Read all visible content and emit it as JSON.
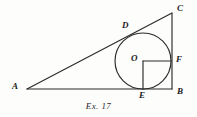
{
  "figure": {
    "caption": "Ex. 17",
    "background_color": "#fdfdfc",
    "stroke_color": "#2b2b2b",
    "labels": {
      "A": "A",
      "B": "B",
      "C": "C",
      "D": "D",
      "E": "E",
      "F": "F",
      "O": "O"
    },
    "label_positions": {
      "A": {
        "x": 12,
        "y": 82
      },
      "B": {
        "x": 177,
        "y": 87
      },
      "C": {
        "x": 177,
        "y": 4
      },
      "D": {
        "x": 122,
        "y": 21
      },
      "E": {
        "x": 139,
        "y": 91
      },
      "F": {
        "x": 176,
        "y": 55
      },
      "O": {
        "x": 131,
        "y": 54
      }
    },
    "geometry": {
      "type": "right-triangle-with-inscribed-circle",
      "triangle": {
        "vertices": {
          "A": {
            "x": 27,
            "y": 89
          },
          "B": {
            "x": 172,
            "y": 89
          },
          "C": {
            "x": 172,
            "y": 13
          }
        },
        "sides": [
          "AB",
          "BC",
          "CA"
        ],
        "right_angle_at": "B"
      },
      "incircle": {
        "center": {
          "x": 143,
          "y": 61
        },
        "radius": 28
      },
      "tangent_points": {
        "D": {
          "x": 130,
          "y": 34
        },
        "E": {
          "x": 143,
          "y": 89
        },
        "F": {
          "x": 171,
          "y": 61
        }
      },
      "radii_drawn": [
        {
          "from": "O",
          "to": "F"
        },
        {
          "from": "O",
          "to": "E"
        }
      ]
    }
  }
}
